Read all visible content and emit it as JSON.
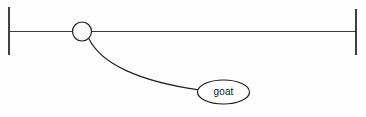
{
  "diagram": {
    "type": "association-line-diagram",
    "background_color": "#fefefe",
    "stroke_color": "#222222",
    "canvas": {
      "width": 366,
      "height": 117
    },
    "tier": {
      "name": "horizontal-timeline",
      "baseline_y": 31.5,
      "x_start": 9,
      "x_end": 356,
      "left_bar": {
        "x": 9,
        "y_top": 7,
        "y_bottom": 55
      },
      "right_bar": {
        "x": 356,
        "y_top": 9,
        "y_bottom": 55
      }
    },
    "node": {
      "name": "circle-node",
      "cx": 82,
      "cy": 31.5,
      "r": 9.5,
      "label": ""
    },
    "association": {
      "name": "curve-to-label",
      "from": {
        "x": 89,
        "y": 39
      },
      "to": {
        "x": 198.5,
        "y": 89.5
      },
      "control1": {
        "x": 101,
        "y": 64
      },
      "control2": {
        "x": 140,
        "y": 81
      }
    },
    "label_ellipse": {
      "name": "goat-ellipse",
      "text": "goat",
      "cx": 223.5,
      "cy": 92,
      "rx": 26,
      "ry": 12
    }
  }
}
